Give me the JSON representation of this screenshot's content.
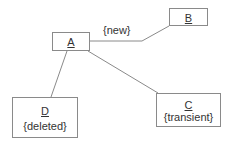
{
  "diagram": {
    "type": "uml-object-diagram",
    "colors": {
      "border": "#8a8a8a",
      "line": "#8a8a8a",
      "text": "#333333",
      "background": "#ffffff"
    },
    "objects": [
      {
        "id": "A",
        "name": "A",
        "constraint": ""
      },
      {
        "id": "B",
        "name": "B",
        "constraint": ""
      },
      {
        "id": "C",
        "name": "C",
        "constraint": "{transient}"
      },
      {
        "id": "D",
        "name": "D",
        "constraint": "{deleted}"
      }
    ],
    "links": [
      {
        "from": "A",
        "to": "B",
        "label": "{new}"
      },
      {
        "from": "A",
        "to": "C",
        "label": ""
      },
      {
        "from": "A",
        "to": "D",
        "label": ""
      }
    ]
  }
}
